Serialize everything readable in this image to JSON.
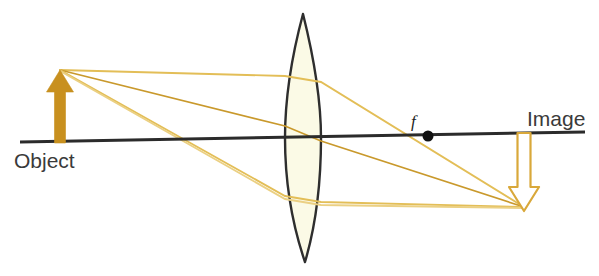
{
  "diagram": {
    "background_color": "#ffffff",
    "labels": {
      "object": "Object",
      "image": "Image",
      "focal_point": "f"
    },
    "colors": {
      "object_arrow_fill": "#C8901F",
      "image_arrow_stroke": "#D9A83A",
      "image_arrow_fill": "#ffffff",
      "ray": "#E3BE57",
      "ray_highlight": "#C9992C",
      "axis": "#2b2b2b",
      "lens_outline": "#2e2e2e",
      "lens_fill": "#FBFAE6",
      "focal_dot": "#111111",
      "text": "#3a3a3a"
    },
    "optical_axis": {
      "x1": 20,
      "y1": 142,
      "x2": 585,
      "y2": 132,
      "stroke_width": 3
    },
    "lens": {
      "center_x": 303,
      "top_y": 14,
      "bottom_y": 262,
      "half_width": 18,
      "stroke_width": 2.4
    },
    "focal_point": {
      "x": 428,
      "y": 136,
      "radius": 5.5,
      "label_x": 411,
      "label_y": 127
    },
    "object_arrow": {
      "x": 60,
      "base_y": 143,
      "tip_y": 70,
      "shaft_width": 11,
      "head_width": 27,
      "head_height": 22
    },
    "image_arrow": {
      "x": 524,
      "base_y": 133,
      "tip_y": 211,
      "shaft_width": 13,
      "head_width": 30,
      "head_height": 24,
      "stroke_width": 2.2
    },
    "rays": [
      {
        "name": "parallel-ray",
        "description": "Parallel to axis before lens, refracted through focal point f to image tip",
        "points": [
          [
            60,
            70
          ],
          [
            285,
            76
          ],
          [
            320,
            82
          ],
          [
            524,
            207
          ]
        ]
      },
      {
        "name": "center-ray",
        "description": "Passes undeviated through the lens center to the image tip",
        "points": [
          [
            60,
            70
          ],
          [
            285,
            126
          ],
          [
            320,
            141
          ],
          [
            524,
            207
          ]
        ]
      },
      {
        "name": "focal-ray",
        "description": "Through near focal point, emerges parallel then converges at image tip",
        "points": [
          [
            60,
            70
          ],
          [
            285,
            196
          ],
          [
            320,
            202
          ],
          [
            524,
            207
          ]
        ]
      },
      {
        "name": "lower-marginal-ray",
        "description": "Low marginal ray running nearly horizontally after the lens",
        "points": [
          [
            60,
            71
          ],
          [
            285,
            199
          ],
          [
            320,
            205
          ],
          [
            524,
            208
          ]
        ]
      }
    ],
    "label_positions": {
      "object": {
        "x": 14,
        "y": 168
      },
      "image": {
        "x": 527,
        "y": 126
      }
    }
  }
}
